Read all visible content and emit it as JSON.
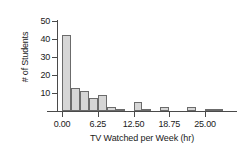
{
  "chart_data": {
    "type": "bar",
    "title": "",
    "xlabel": "TV Watched per Week (hr)",
    "ylabel": "# of Students",
    "xlim": [
      -1.5,
      29
    ],
    "ylim": [
      0,
      50
    ],
    "xticks": [
      "0.00",
      "6.25",
      "12.50",
      "18.75",
      "25.00"
    ],
    "xtick_values": [
      0,
      6.25,
      12.5,
      18.75,
      25
    ],
    "yticks": [
      "10",
      "20",
      "30",
      "40",
      "50"
    ],
    "ytick_values": [
      10,
      20,
      30,
      40,
      50
    ],
    "grid": false,
    "legend": false,
    "bin_width": 1.5625,
    "bin_starts": [
      0,
      1.5625,
      3.125,
      4.6875,
      6.25,
      7.8125,
      9.375,
      10.9375,
      12.5,
      14.0625,
      15.625,
      17.1875,
      18.75,
      20.3125,
      21.875,
      23.4375,
      25,
      26.5625
    ],
    "categories": [
      "0.00-1.56",
      "1.56-3.13",
      "3.13-4.69",
      "4.69-6.25",
      "6.25-7.81",
      "7.81-9.38",
      "9.38-10.94",
      "10.94-12.50",
      "12.50-14.06",
      "14.06-15.63",
      "15.63-17.19",
      "17.19-18.75",
      "18.75-20.31",
      "20.31-21.88",
      "21.88-23.44",
      "23.44-25.00",
      "25.00-26.56",
      "26.56-28.13"
    ],
    "values": [
      42,
      13,
      11,
      7,
      9,
      2,
      1,
      0,
      5,
      1,
      0,
      2,
      0,
      0,
      2,
      0,
      1,
      1
    ],
    "bar_fill_color": "#d6d6d6",
    "bar_edge_color": "#6b6b6b",
    "axis_color": "#4a4a4a",
    "background_color": "#ffffff"
  }
}
